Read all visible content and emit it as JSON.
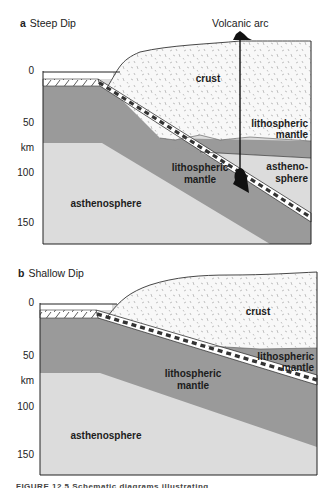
{
  "figure": {
    "panels": [
      {
        "letter": "a",
        "title": "Steep Dip",
        "axis": {
          "ticks": [
            "0",
            "50",
            "km",
            "100",
            "150"
          ]
        },
        "labels": {
          "volcanic_arc": "Volcanic arc",
          "crust": "crust",
          "over_lith_1": "lithospheric",
          "over_lith_2": "mantle",
          "astheno_r_1": "astheno-",
          "astheno_r_2": "sphere",
          "slab_lith_1": "lithospheric",
          "slab_lith_2": "mantle",
          "asthenosphere": "asthenosphere"
        }
      },
      {
        "letter": "b",
        "title": "Shallow Dip",
        "axis": {
          "ticks": [
            "0",
            "50",
            "km",
            "100",
            "150"
          ]
        },
        "labels": {
          "crust": "crust",
          "over_lith_1": "lithospheric",
          "over_lith_2": "mantle",
          "slab_lith_1": "lithospheric",
          "slab_lith_2": "mantle",
          "asthenosphere": "asthenosphere"
        }
      }
    ],
    "caption": "FIGURE 12.5   Schematic diagrams illustrating"
  },
  "colors": {
    "lithospheric_mantle": "#9a9a9a",
    "asthenosphere": "#dcdcdc",
    "crust": "#f7f7f7",
    "outline": "#222222"
  }
}
